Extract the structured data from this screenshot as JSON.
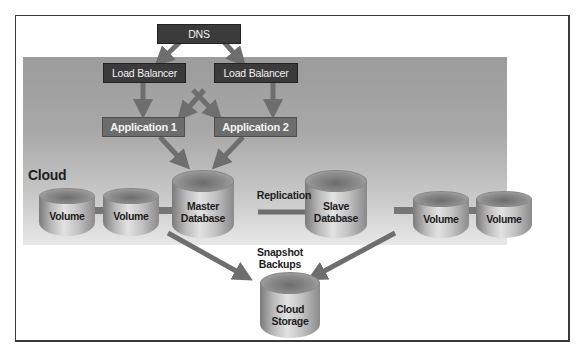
{
  "diagram": {
    "region_label": "Cloud",
    "nodes": {
      "dns": "DNS",
      "load_balancer_1": "Load Balancer",
      "load_balancer_2": "Load Balancer",
      "application_1": "Application 1",
      "application_2": "Application 2",
      "master_db": {
        "line1": "Master",
        "line2": "Database"
      },
      "slave_db": {
        "line1": "Slave",
        "line2": "Database"
      },
      "volumes": [
        "Volume",
        "Volume",
        "Volume",
        "Volume"
      ],
      "cloud_storage": {
        "line1": "Cloud",
        "line2": "Storage"
      }
    },
    "edge_labels": {
      "replication": "Replication",
      "snapshot_line1": "Snapshot",
      "snapshot_line2": "Backups"
    },
    "colors": {
      "dark_box": "#3b3b3b",
      "app_box": "#6c6c6c",
      "arrow": "#6e6e6e",
      "cloud_band": "#a8a8a8"
    }
  }
}
